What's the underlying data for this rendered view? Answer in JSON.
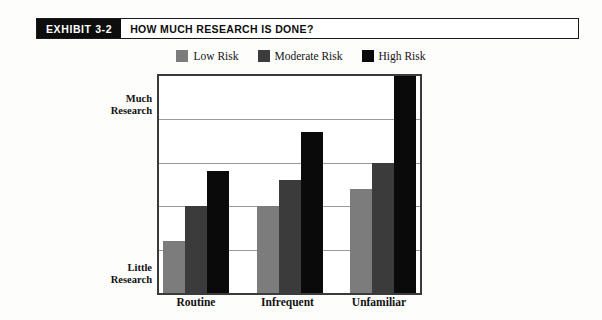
{
  "exhibit": {
    "tag": "EXHIBIT 3-2",
    "title": "HOW MUCH RESEARCH IS DONE?"
  },
  "colors": {
    "low_risk": "#7c7c7c",
    "moderate_risk": "#3b3b3b",
    "high_risk": "#0a0a0a",
    "frame": "#3a3a3a",
    "gridline": "#9a9a9a"
  },
  "chart_data": {
    "type": "bar",
    "title": "HOW MUCH RESEARCH IS DONE?",
    "xlabel": "",
    "ylabel": "",
    "categories": [
      "Routine",
      "Infrequent",
      "Unfamiliar"
    ],
    "series": [
      {
        "name": "Low Risk",
        "color": "#7c7c7c",
        "values": [
          1.2,
          2.0,
          2.4
        ]
      },
      {
        "name": "Moderate Risk",
        "color": "#3b3b3b",
        "values": [
          2.0,
          2.6,
          3.0
        ]
      },
      {
        "name": "High Risk",
        "color": "#0a0a0a",
        "values": [
          2.8,
          3.7,
          5.0
        ]
      }
    ],
    "ylim": [
      0,
      5
    ],
    "y_axis_ticks": [
      {
        "value": 5,
        "label": "Much Research"
      },
      {
        "value": 0,
        "label": "Little Research"
      }
    ],
    "y_axis_label_top_line1": "Much",
    "y_axis_label_top_line2": "Research",
    "y_axis_label_bottom_line1": "Little",
    "y_axis_label_bottom_line2": "Research",
    "gridlines": [
      1,
      2,
      3,
      4
    ],
    "grid": true,
    "legend_position": "top-center",
    "legend": [
      "Low Risk",
      "Moderate Risk",
      "High Risk"
    ]
  }
}
